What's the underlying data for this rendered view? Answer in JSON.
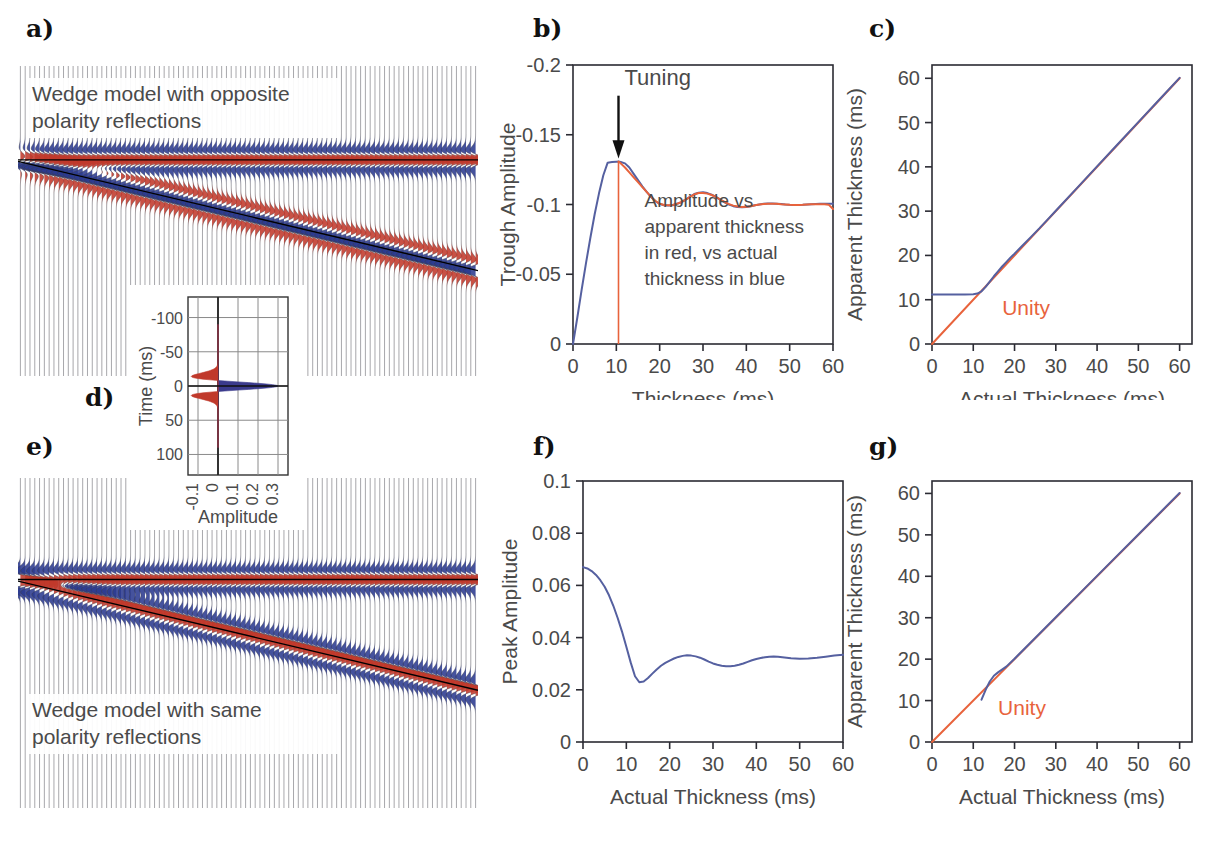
{
  "figure": {
    "panel_labels": {
      "a": "a)",
      "b": "b)",
      "c": "c)",
      "d": "d)",
      "e": "e)",
      "f": "f)",
      "g": "g)"
    }
  },
  "panel_a": {
    "caption_line1": "Wedge model with opposite",
    "caption_line2": "polarity reflections",
    "colors": {
      "peak": "#c0392b",
      "trough": "#2b3a8f"
    }
  },
  "panel_e": {
    "caption_line1": "Wedge model with same",
    "caption_line2": "polarity reflections",
    "colors": {
      "peak": "#c0392b",
      "trough": "#2b3a8f"
    }
  },
  "panel_d": {
    "xlabel": "Amplitude",
    "ylabel": "Time (ms)",
    "xticks": [
      "-0.1",
      "0",
      "0.1",
      "0.2",
      "0.3"
    ],
    "yticks": [
      "-100",
      "-50",
      "0",
      "50",
      "100"
    ],
    "colors": {
      "positive": "#3a3a8c",
      "negative": "#c0392b"
    }
  },
  "chart_data": [
    {
      "id": "panel_b",
      "type": "line",
      "title": "",
      "xlabel": "Thickness (ms)",
      "ylabel": "Trough Amplitude",
      "xlim": [
        0,
        60
      ],
      "ylim": [
        0,
        -0.2
      ],
      "xticks": [
        0,
        10,
        20,
        30,
        40,
        50,
        60
      ],
      "yticks": [
        0,
        -0.05,
        -0.1,
        -0.15,
        -0.2
      ],
      "ytick_labels": [
        "0",
        "-0.05",
        "-0.1",
        "-0.15",
        "-0.2"
      ],
      "grid": false,
      "legend": "none",
      "annotations": [
        {
          "name": "tuning",
          "text": "Tuning",
          "x": 10.5,
          "y": -0.185
        },
        {
          "name": "legend-note",
          "text": "Amplitude vs\napparent thickness\nin red, vs actual\nthickness in blue",
          "x": 17,
          "y": -0.09
        }
      ],
      "tuning_thickness": 10.5,
      "series": [
        {
          "name": "vs actual thickness",
          "color": "#5560a0",
          "x": [
            0,
            1,
            2,
            3,
            4,
            5,
            6,
            7,
            8,
            9,
            10,
            10.5,
            11,
            12,
            13,
            14,
            15,
            16,
            17,
            18,
            19,
            20,
            21,
            22,
            23,
            24,
            25,
            26,
            27,
            28,
            29,
            30,
            31,
            32,
            33,
            34,
            35,
            36,
            37,
            38,
            39,
            40,
            41,
            42,
            43,
            44,
            45,
            46,
            47,
            48,
            49,
            50,
            51,
            52,
            53,
            54,
            55,
            56,
            57,
            58,
            59,
            60
          ],
          "y": [
            0,
            -0.019,
            -0.039,
            -0.058,
            -0.076,
            -0.093,
            -0.108,
            -0.121,
            -0.13,
            -0.1305,
            -0.1307,
            -0.1308,
            -0.1305,
            -0.1295,
            -0.1265,
            -0.122,
            -0.1175,
            -0.113,
            -0.109,
            -0.1055,
            -0.1025,
            -0.1005,
            -0.0995,
            -0.0993,
            -0.0995,
            -0.1005,
            -0.1015,
            -0.1035,
            -0.1055,
            -0.1075,
            -0.1085,
            -0.1087,
            -0.1082,
            -0.107,
            -0.1055,
            -0.1035,
            -0.1015,
            -0.1,
            -0.0988,
            -0.0982,
            -0.098,
            -0.0982,
            -0.0988,
            -0.0995,
            -0.1,
            -0.1005,
            -0.1008,
            -0.1008,
            -0.1006,
            -0.1003,
            -0.1,
            -0.0998,
            -0.0997,
            -0.0997,
            -0.0998,
            -0.1,
            -0.1002,
            -0.1004,
            -0.1005,
            -0.1006,
            -0.1006,
            -0.1005
          ]
        },
        {
          "name": "vs apparent thickness",
          "color": "#e8633c",
          "x": [
            10.5,
            11,
            12,
            13,
            14,
            15,
            16,
            17,
            18,
            19,
            20,
            21,
            22,
            23,
            24,
            25,
            26,
            27,
            28,
            29,
            30,
            31,
            32,
            33,
            34,
            35,
            36,
            37,
            38,
            39,
            40,
            41,
            42,
            43,
            44,
            45,
            46,
            47,
            48,
            49,
            50,
            51,
            52,
            53,
            54,
            55,
            56,
            57,
            58,
            59,
            60
          ],
          "y": [
            -0.1308,
            -0.1295,
            -0.1265,
            -0.123,
            -0.1195,
            -0.116,
            -0.1125,
            -0.109,
            -0.1055,
            -0.1025,
            -0.1005,
            -0.0997,
            -0.0995,
            -0.0997,
            -0.1005,
            -0.1018,
            -0.1035,
            -0.1055,
            -0.1072,
            -0.1082,
            -0.1083,
            -0.1078,
            -0.1068,
            -0.1053,
            -0.1035,
            -0.1018,
            -0.1003,
            -0.0992,
            -0.0985,
            -0.0982,
            -0.0983,
            -0.0988,
            -0.0995,
            -0.1,
            -0.1004,
            -0.1006,
            -0.1006,
            -0.1005,
            -0.1002,
            -0.1,
            -0.0998,
            -0.0997,
            -0.0997,
            -0.0998,
            -0.1,
            -0.1001,
            -0.1002,
            -0.1002,
            -0.1001,
            -0.0999,
            -0.0968
          ]
        }
      ]
    },
    {
      "id": "panel_c",
      "type": "line",
      "title": "",
      "xlabel": "Actual Thickness (ms)",
      "ylabel": "Apparent Thickness (ms)",
      "xlim": [
        0,
        63
      ],
      "ylim": [
        0,
        63
      ],
      "xticks": [
        0,
        10,
        20,
        30,
        40,
        50,
        60
      ],
      "yticks": [
        0,
        10,
        20,
        30,
        40,
        50,
        60
      ],
      "grid": false,
      "legend": "none",
      "annotations": [
        {
          "name": "unity-label",
          "text": "Unity",
          "x": 17,
          "y": 6.5
        }
      ],
      "series": [
        {
          "name": "Unity",
          "color": "#e8633c",
          "x": [
            0,
            60
          ],
          "y": [
            0,
            60
          ]
        },
        {
          "name": "Apparent thickness",
          "color": "#5560a0",
          "x": [
            0,
            2,
            4,
            6,
            8,
            10,
            11,
            12,
            13,
            14,
            15,
            16,
            17,
            18,
            19,
            20,
            22,
            24,
            26,
            28,
            30,
            35,
            40,
            45,
            50,
            55,
            60
          ],
          "y": [
            11.2,
            11.2,
            11.2,
            11.2,
            11.2,
            11.25,
            11.4,
            11.9,
            12.9,
            14.1,
            15.3,
            16.4,
            17.5,
            18.5,
            19.5,
            20.4,
            22.3,
            24.2,
            26.1,
            28.1,
            30.1,
            35.1,
            40.1,
            45.1,
            50.1,
            55.1,
            60.1
          ]
        }
      ]
    },
    {
      "id": "panel_f",
      "type": "line",
      "title": "",
      "xlabel": "Actual Thickness (ms)",
      "ylabel": "Peak Amplitude",
      "xlim": [
        0,
        60
      ],
      "ylim": [
        0,
        0.1
      ],
      "xticks": [
        0,
        10,
        20,
        30,
        40,
        50,
        60
      ],
      "yticks": [
        0,
        0.02,
        0.04,
        0.06,
        0.08,
        0.1
      ],
      "ytick_labels": [
        "0",
        "0.02",
        "0.04",
        "0.06",
        "0.08",
        "0.1"
      ],
      "grid": false,
      "legend": "none",
      "annotations": [],
      "series": [
        {
          "name": "Peak amplitude",
          "color": "#5560a0",
          "x": [
            0,
            1,
            2,
            3,
            4,
            5,
            6,
            7,
            8,
            9,
            10,
            11,
            12,
            13,
            14,
            15,
            16,
            17,
            18,
            19,
            20,
            21,
            22,
            23,
            24,
            25,
            26,
            27,
            28,
            29,
            30,
            31,
            32,
            33,
            34,
            35,
            36,
            37,
            38,
            39,
            40,
            41,
            42,
            43,
            44,
            45,
            46,
            47,
            48,
            49,
            50,
            52,
            54,
            56,
            58,
            60
          ],
          "y": [
            0.067,
            0.0665,
            0.0655,
            0.064,
            0.062,
            0.0595,
            0.0562,
            0.0522,
            0.0475,
            0.0423,
            0.0365,
            0.0305,
            0.0252,
            0.0229,
            0.0232,
            0.0245,
            0.0262,
            0.0278,
            0.0292,
            0.0303,
            0.0312,
            0.032,
            0.0326,
            0.033,
            0.0332,
            0.0331,
            0.0328,
            0.0323,
            0.0316,
            0.0308,
            0.0301,
            0.0296,
            0.0292,
            0.029,
            0.029,
            0.0292,
            0.0296,
            0.0301,
            0.0307,
            0.0313,
            0.0318,
            0.0322,
            0.0325,
            0.0327,
            0.0328,
            0.0327,
            0.0325,
            0.0323,
            0.0321,
            0.032,
            0.0319,
            0.032,
            0.0323,
            0.0327,
            0.0331,
            0.0334
          ]
        }
      ]
    },
    {
      "id": "panel_g",
      "type": "line",
      "title": "",
      "xlabel": "Actual Thickness (ms)",
      "ylabel": "Apparent Thickness (ms)",
      "xlim": [
        0,
        63
      ],
      "ylim": [
        0,
        63
      ],
      "xticks": [
        0,
        10,
        20,
        30,
        40,
        50,
        60
      ],
      "yticks": [
        0,
        10,
        20,
        30,
        40,
        50,
        60
      ],
      "grid": false,
      "legend": "none",
      "annotations": [
        {
          "name": "unity-label",
          "text": "Unity",
          "x": 16,
          "y": 6.5
        }
      ],
      "series": [
        {
          "name": "Unity",
          "color": "#e8633c",
          "x": [
            0,
            60
          ],
          "y": [
            0,
            60
          ]
        },
        {
          "name": "Apparent thickness",
          "color": "#5560a0",
          "x": [
            12,
            13,
            14,
            15,
            16,
            18,
            20,
            25,
            30,
            35,
            40,
            45,
            50,
            55,
            60
          ],
          "y": [
            10.2,
            12.6,
            14.6,
            16.0,
            16.8,
            18.2,
            20.1,
            25.1,
            30.1,
            35.1,
            40.1,
            45.1,
            50.1,
            55.1,
            60.1
          ]
        }
      ]
    }
  ]
}
